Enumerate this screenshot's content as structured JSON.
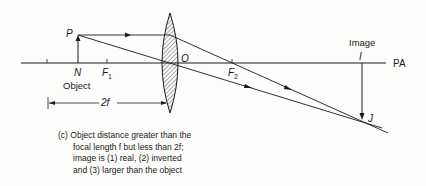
{
  "diagram": {
    "labels": {
      "P": "P",
      "N": "N",
      "object": "Object",
      "F1": "F",
      "F1_sub": "1",
      "O": "O",
      "F2": "F",
      "F2_sub": "2",
      "image": "Image",
      "I": "I",
      "PA": "PA",
      "J": "J",
      "two_f": "2f"
    },
    "caption": {
      "marker": "(c)",
      "lines": [
        "Object distance greater than the",
        "focal length f but less than 2f;",
        "image is (1) real, (2) inverted",
        "and (3) larger than the object"
      ]
    },
    "colors": {
      "ink": "#1a1a1a",
      "background": "#fdfdfb"
    }
  }
}
